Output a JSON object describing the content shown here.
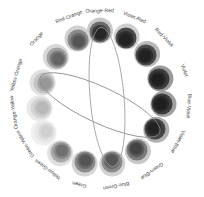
{
  "diagram": {
    "center": [
      101,
      99
    ],
    "label_radius": 88,
    "swatches": [
      {
        "label": "Orange-Red",
        "cx": 100,
        "cy": 32,
        "tones": [
          "#c8c8c8",
          "#6a6a6a",
          "#3a3a3a",
          "#262626"
        ]
      },
      {
        "label": "Violet-Red",
        "cx": 126,
        "cy": 38,
        "tones": [
          "#d0d0d0",
          "#4a4a4a",
          "#2e2e2e",
          "#222222"
        ]
      },
      {
        "label": "Red-Violet",
        "cx": 146,
        "cy": 55,
        "tones": [
          "#b8b8b8",
          "#4a4a4a",
          "#2e2e2e",
          "#222222"
        ]
      },
      {
        "label": "Violet",
        "cx": 159,
        "cy": 79,
        "tones": [
          "#9a9a9a",
          "#3c3c3c",
          "#2a2a2a",
          "#1e1e1e"
        ]
      },
      {
        "label": "Blue-Violet",
        "cx": 162,
        "cy": 104,
        "tones": [
          "#a0a0a0",
          "#3c3c3c",
          "#2a2a2a",
          "#1e1e1e"
        ]
      },
      {
        "label": "Violet-Blue",
        "cx": 155,
        "cy": 129,
        "tones": [
          "#b0b0b0",
          "#444444",
          "#303030",
          "#222222"
        ]
      },
      {
        "label": "Green-Blue",
        "cx": 137,
        "cy": 150,
        "tones": [
          "#c8c8c8",
          "#7a7a7a",
          "#5a5a5a",
          "#444444"
        ]
      },
      {
        "label": "Blue-Green",
        "cx": 112,
        "cy": 162,
        "tones": [
          "#d2d2d2",
          "#8a8a8a",
          "#6a6a6a",
          "#555555"
        ]
      },
      {
        "label": "Green",
        "cx": 85,
        "cy": 162,
        "tones": [
          "#d4d4d4",
          "#8a8a8a",
          "#6a6a6a",
          "#555555"
        ]
      },
      {
        "label": "Yellow-Green",
        "cx": 61,
        "cy": 152,
        "tones": [
          "#e0e0e0",
          "#a8a8a8",
          "#888888",
          "#707070"
        ]
      },
      {
        "label": "Green-Yellow",
        "cx": 45,
        "cy": 132,
        "tones": [
          "#f0f0f0",
          "#e6e6e6",
          "#dadada",
          "#d0d0d0"
        ]
      },
      {
        "label": "Orange-Yellow",
        "cx": 41,
        "cy": 108,
        "tones": [
          "#e8e8e8",
          "#d4d4d4",
          "#c4c4c4",
          "#b8b8b8"
        ]
      },
      {
        "label": "Yellow-Orange",
        "cx": 44,
        "cy": 83,
        "tones": [
          "#e0e0e0",
          "#c4c4c4",
          "#a8a8a8",
          "#989898"
        ]
      },
      {
        "label": "Orange",
        "cx": 57,
        "cy": 58,
        "tones": [
          "#d8d8d8",
          "#a0a0a0",
          "#7a7a7a",
          "#646464"
        ]
      },
      {
        "label": "Red-Orange",
        "cx": 78,
        "cy": 40,
        "tones": [
          "#d0d0d0",
          "#8a8a8a",
          "#6a6a6a",
          "#555555"
        ]
      }
    ],
    "ellipses": [
      {
        "name": "tilted-ellipse",
        "cx": 100,
        "cy": 105,
        "rx": 66,
        "ry": 18,
        "rotate": 25,
        "stroke": "#8a8a8a"
      },
      {
        "name": "vertical-ellipse",
        "cx": 107,
        "cy": 97,
        "rx": 17,
        "ry": 70,
        "rotate": -5,
        "stroke": "#9a9a9a"
      }
    ]
  }
}
